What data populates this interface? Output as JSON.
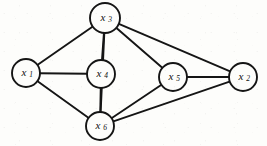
{
  "figure": {
    "type": "undirected-graph",
    "title": "",
    "background_color": "#fdfdfb",
    "stroke_color": "#151515",
    "node_fill_color": "#fdfdfb"
  },
  "nodes": [
    {
      "id": "x1",
      "base": "x",
      "sub": "1",
      "label": "x1",
      "cx": 26,
      "cy": 73,
      "r": 14
    },
    {
      "id": "x2",
      "base": "x",
      "sub": "2",
      "label": "x2",
      "cx": 243,
      "cy": 77,
      "r": 14
    },
    {
      "id": "x3",
      "base": "x",
      "sub": "3",
      "label": "x3",
      "cx": 105,
      "cy": 18,
      "r": 15
    },
    {
      "id": "x4",
      "base": "x",
      "sub": "4",
      "label": "x4",
      "cx": 101,
      "cy": 74,
      "r": 14
    },
    {
      "id": "x5",
      "base": "x",
      "sub": "5",
      "label": "x5",
      "cx": 173,
      "cy": 77,
      "r": 14
    },
    {
      "id": "x6",
      "base": "x",
      "sub": "6",
      "label": "x6",
      "cx": 100,
      "cy": 126,
      "r": 14
    }
  ],
  "edges": [
    {
      "from": "x1",
      "to": "x3"
    },
    {
      "from": "x1",
      "to": "x4"
    },
    {
      "from": "x1",
      "to": "x6"
    },
    {
      "from": "x3",
      "to": "x4"
    },
    {
      "from": "x3",
      "to": "x5"
    },
    {
      "from": "x3",
      "to": "x2"
    },
    {
      "from": "x4",
      "to": "x6"
    },
    {
      "from": "x5",
      "to": "x6"
    },
    {
      "from": "x5",
      "to": "x2"
    },
    {
      "from": "x6",
      "to": "x2"
    },
    {
      "from": "x3",
      "to": "x6"
    }
  ]
}
